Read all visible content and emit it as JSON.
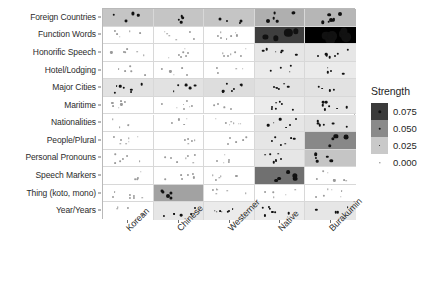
{
  "chart_data": {
    "type": "heatmap",
    "title": "",
    "xlabel": "",
    "ylabel": "",
    "legend_title": "Strength",
    "legend_position": "right",
    "grid": true,
    "value_key": "Strength",
    "columns": [
      "Korean",
      "Chinese",
      "Westerner",
      "Native",
      "Burakumin"
    ],
    "rows": [
      "Foreign Countries",
      "Function Words",
      "Honorific Speech",
      "Hotel/Lodging",
      "Major Cities",
      "Maritime",
      "Nationalities",
      "People/Plural",
      "Personal Pronouns",
      "Speech Markers",
      "Thing (koto, mono)",
      "Year/Years"
    ],
    "legend_entries": [
      {
        "label": "0.075",
        "value": 0.075,
        "swatch": "#3b3b3b",
        "dot": 3.4
      },
      {
        "label": "0.050",
        "value": 0.05,
        "swatch": "#8a8a8a",
        "dot": 2.6
      },
      {
        "label": "0.025",
        "value": 0.025,
        "swatch": "#c9c9c9",
        "dot": 1.9
      },
      {
        "label": "0.000",
        "value": 0.0,
        "swatch": "#ffffff",
        "dot": 1.3
      }
    ],
    "values": [
      [
        0.012,
        0.012,
        0.012,
        0.018,
        0.016
      ],
      [
        0.0,
        0.0,
        0.0,
        0.056,
        0.082
      ],
      [
        0.0,
        0.0,
        0.0,
        0.004,
        0.004
      ],
      [
        0.0,
        0.0,
        0.0,
        0.003,
        0.003
      ],
      [
        0.005,
        0.005,
        0.006,
        0.005,
        0.005
      ],
      [
        0.0,
        0.0,
        0.0,
        0.003,
        0.004
      ],
      [
        0.0,
        0.0,
        0.0,
        0.004,
        0.005
      ],
      [
        0.0,
        0.0,
        0.0,
        0.004,
        0.03
      ],
      [
        0.0,
        0.0,
        0.0,
        0.004,
        0.012
      ],
      [
        0.0,
        0.0,
        0.0,
        0.038,
        0.0
      ],
      [
        0.0,
        0.022,
        0.0,
        0.0,
        0.0
      ],
      [
        0.0,
        0.004,
        0.003,
        0.003,
        0.004
      ]
    ]
  }
}
